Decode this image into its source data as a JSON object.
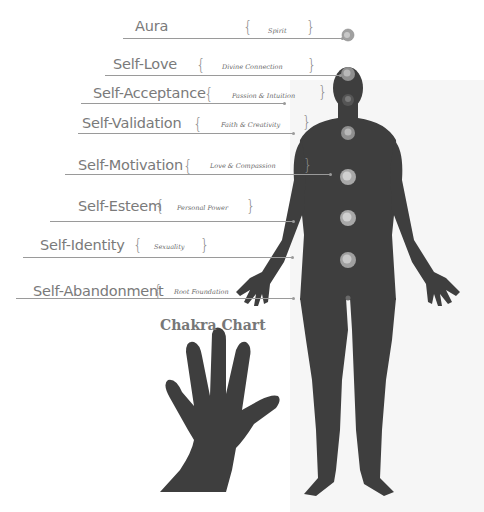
{
  "title": "Chakra Chart",
  "colors": {
    "figure": "#3e3e3e",
    "label_text": "#7a7a7a",
    "lines": "#9a9a9a",
    "orb": "#b0b0b0"
  },
  "chakras": [
    {
      "label": "Aura",
      "meaning": "Spirit"
    },
    {
      "label": "Self-Love",
      "meaning": "Divine Connection"
    },
    {
      "label": "Self-Acceptance",
      "meaning": "Passion & Intuition"
    },
    {
      "label": "Self-Validation",
      "meaning": "Faith & Creativity"
    },
    {
      "label": "Self-Motivation",
      "meaning": "Love & Compassion"
    },
    {
      "label": "Self-Esteem",
      "meaning": "Personal Power"
    },
    {
      "label": "Self-Identity",
      "meaning": "Sexuality"
    },
    {
      "label": "Self-Abandonment",
      "meaning": "Root Foundation"
    }
  ]
}
